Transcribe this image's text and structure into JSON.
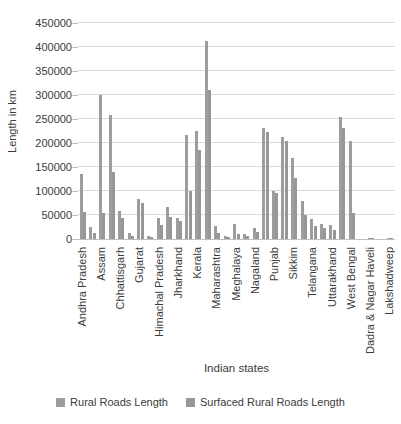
{
  "chart_data": {
    "type": "bar",
    "ylabel": "Length in km",
    "xlabel": "Indian states",
    "ylim": [
      0,
      450000
    ],
    "yticks": [
      0,
      50000,
      100000,
      150000,
      200000,
      250000,
      300000,
      350000,
      400000,
      450000
    ],
    "grid": "horizontal",
    "legend_position": "bottom",
    "series": [
      {
        "name": "Rural Roads Length",
        "color": "#9d9d9d"
      },
      {
        "name": "Surfaced Rural Roads Length",
        "color": "#979797"
      }
    ],
    "groups": [
      {
        "label": "Andhra Pradesh",
        "values": [
          135000,
          57000
        ]
      },
      {
        "label": "",
        "values": [
          26000,
          12000
        ]
      },
      {
        "label": "Assam",
        "values": [
          301000,
          55000
        ]
      },
      {
        "label": "",
        "values": [
          258000,
          140000
        ]
      },
      {
        "label": "Chhattisgarh",
        "values": [
          58000,
          43000
        ]
      },
      {
        "label": "",
        "values": [
          12000,
          7000
        ]
      },
      {
        "label": "Gujarat",
        "values": [
          83000,
          74000
        ]
      },
      {
        "label": "",
        "values": [
          6500,
          5000
        ]
      },
      {
        "label": "Himachal Pradesh",
        "values": [
          43000,
          28500
        ]
      },
      {
        "label": "",
        "values": [
          67000,
          46500
        ]
      },
      {
        "label": "Jharkhand",
        "values": [
          44000,
          38000
        ]
      },
      {
        "label": "",
        "values": [
          216000,
          100000
        ]
      },
      {
        "label": "Kerala",
        "values": [
          226000,
          185000
        ]
      },
      {
        "label": "",
        "values": [
          413000,
          310000
        ]
      },
      {
        "label": "Maharashtra",
        "values": [
          27000,
          12000
        ]
      },
      {
        "label": "",
        "values": [
          7000,
          5000
        ]
      },
      {
        "label": "Meghalaya",
        "values": [
          31000,
          11000
        ]
      },
      {
        "label": "",
        "values": [
          9500,
          6000
        ]
      },
      {
        "label": "Nagaland",
        "values": [
          23500,
          14500
        ]
      },
      {
        "label": "",
        "values": [
          232000,
          223000
        ]
      },
      {
        "label": "Punjab",
        "values": [
          101000,
          96000
        ]
      },
      {
        "label": "",
        "values": [
          212000,
          204000
        ]
      },
      {
        "label": "Sikkim",
        "values": [
          169000,
          127000
        ]
      },
      {
        "label": "",
        "values": [
          80000,
          50000
        ]
      },
      {
        "label": "Telangana",
        "values": [
          42000,
          28000
        ]
      },
      {
        "label": "",
        "values": [
          32000,
          22000
        ]
      },
      {
        "label": "Uttarakhand",
        "values": [
          29000,
          18000
        ]
      },
      {
        "label": "",
        "values": [
          255000,
          232000
        ]
      },
      {
        "label": "West Bengal",
        "values": [
          204000,
          55000
        ]
      },
      {
        "label": "",
        "values": [
          0,
          0
        ]
      },
      {
        "label": "Dadra & Nagar Haveli",
        "values": [
          2500,
          1500
        ]
      },
      {
        "label": "",
        "values": [
          0,
          0
        ]
      },
      {
        "label": "Lakshadweep",
        "values": [
          1500,
          800
        ]
      }
    ]
  },
  "colors": {
    "gridline": "#d9d9d9",
    "axis": "#bfbfbf",
    "text": "#3b3b3b",
    "background": "#ffffff"
  }
}
